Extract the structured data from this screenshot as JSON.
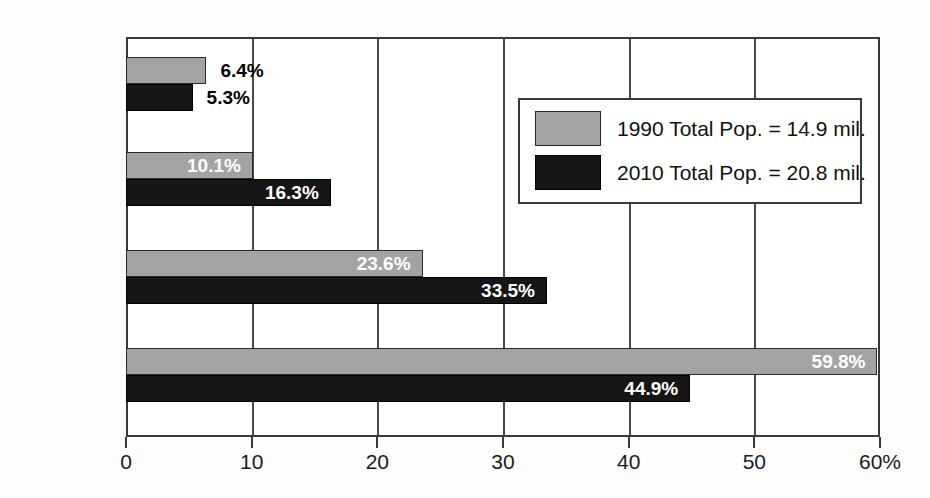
{
  "chart_data": {
    "type": "bar",
    "orientation": "horizontal",
    "title": "",
    "subtitle": "",
    "xlabel": "",
    "ylabel": "",
    "xlim": [
      0,
      60
    ],
    "xticks": [
      0,
      10,
      20,
      30,
      40,
      50,
      60
    ],
    "xtick_labels": [
      "0",
      "10",
      "20",
      "30",
      "40",
      "50",
      "60%"
    ],
    "grid": true,
    "grid_axis": "x",
    "legend_position": "upper right",
    "categories": [
      "Black",
      "Asian and Other",
      "Hispanic",
      "White"
    ],
    "series": [
      {
        "name": "1990 Total Pop. = 14.9 mil.",
        "color": "#a3a3a3",
        "values": [
          6.4,
          10.1,
          23.6,
          59.8
        ],
        "labels": [
          "6.4%",
          "10.1%",
          "23.6%",
          "59.8%"
        ]
      },
      {
        "name": "2010 Total Pop. = 20.8 mil.",
        "color": "#161616",
        "values": [
          5.3,
          16.3,
          33.5,
          44.9
        ],
        "labels": [
          "5.3%",
          "16.3%",
          "33.5%",
          "44.9%"
        ]
      }
    ]
  },
  "axis": {
    "ticks": [
      {
        "value": 0,
        "label": "0"
      },
      {
        "value": 10,
        "label": "10"
      },
      {
        "value": 20,
        "label": "20"
      },
      {
        "value": 30,
        "label": "30"
      },
      {
        "value": 40,
        "label": "40"
      },
      {
        "value": 50,
        "label": "50"
      },
      {
        "value": 60,
        "label": "60%"
      }
    ]
  },
  "categories": [
    {
      "label": "Black"
    },
    {
      "label": "Asian and\nOther"
    },
    {
      "label": "Hispanic"
    },
    {
      "label": "White"
    }
  ],
  "legend": {
    "entries": [
      {
        "swatch": "light",
        "text": "1990 Total Pop. = 14.9 mil."
      },
      {
        "swatch": "dark",
        "text": "2010 Total Pop. = 20.8 mil."
      }
    ]
  },
  "colors": {
    "series_1990": "#a3a3a3",
    "series_2010": "#161616",
    "frame": "#3a3a3a",
    "background": "#ffffff"
  }
}
